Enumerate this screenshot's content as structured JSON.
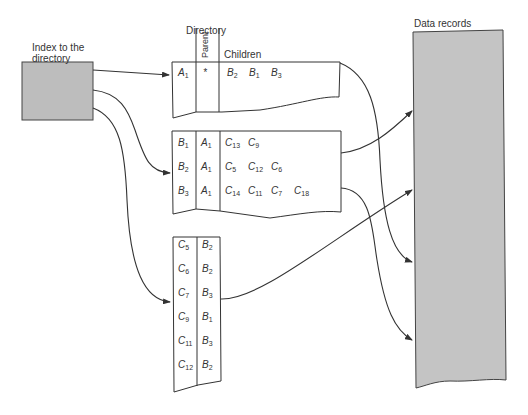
{
  "labels": {
    "index": [
      "Index to the",
      "directory"
    ],
    "directory": "Directory",
    "parent": "Parent",
    "children": "Children",
    "data_records": "Data records"
  },
  "colors": {
    "box_fill": "#bdbdbd",
    "data_fill": "#c4c4c4",
    "stroke": "#333333"
  },
  "directory_tables": [
    {
      "name": "root-level",
      "rows": [
        {
          "key": [
            "A",
            "1"
          ],
          "parent": [
            "*",
            ""
          ],
          "children": [
            [
              "B",
              "2"
            ],
            [
              "B",
              "1"
            ],
            [
              "B",
              "3"
            ]
          ]
        }
      ]
    },
    {
      "name": "b-level",
      "rows": [
        {
          "key": [
            "B",
            "1"
          ],
          "parent": [
            "A",
            "1"
          ],
          "children": [
            [
              "C",
              "13"
            ],
            [
              "C",
              "9"
            ]
          ]
        },
        {
          "key": [
            "B",
            "2"
          ],
          "parent": [
            "A",
            "1"
          ],
          "children": [
            [
              "C",
              "5"
            ],
            [
              "C",
              "12"
            ],
            [
              "C",
              "6"
            ]
          ]
        },
        {
          "key": [
            "B",
            "3"
          ],
          "parent": [
            "A",
            "1"
          ],
          "children": [
            [
              "C",
              "14"
            ],
            [
              "C",
              "11"
            ],
            [
              "C",
              "7"
            ],
            [
              "C",
              "18"
            ]
          ]
        }
      ]
    },
    {
      "name": "c-level",
      "rows": [
        {
          "key": [
            "C",
            "5"
          ],
          "parent": [
            "B",
            "2"
          ]
        },
        {
          "key": [
            "C",
            "6"
          ],
          "parent": [
            "B",
            "2"
          ]
        },
        {
          "key": [
            "C",
            "7"
          ],
          "parent": [
            "B",
            "3"
          ]
        },
        {
          "key": [
            "C",
            "9"
          ],
          "parent": [
            "B",
            "1"
          ]
        },
        {
          "key": [
            "C",
            "11"
          ],
          "parent": [
            "B",
            "3"
          ]
        },
        {
          "key": [
            "C",
            "12"
          ],
          "parent": [
            "B",
            "2"
          ]
        }
      ]
    }
  ]
}
